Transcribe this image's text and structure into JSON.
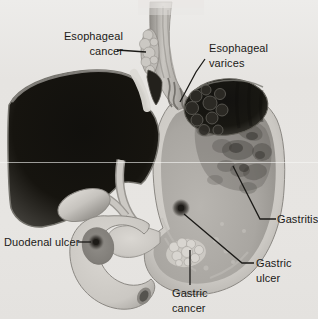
{
  "illustration": {
    "title": "Upper digestive tract disorders diagram",
    "background": "#e7e5e2",
    "ink": "#1b1a17",
    "labels": {
      "esophageal_cancer": {
        "line1": "Esophageal",
        "line2": "cancer"
      },
      "esophageal_varices": {
        "line1": "Esophageal",
        "line2": "varices"
      },
      "gastritis": {
        "text": "Gastritis"
      },
      "duodenal_ulcer": {
        "text": "Duodenal ulcer"
      },
      "gastric_ulcer": {
        "line1": "Gastric",
        "line2": "ulcer"
      },
      "gastric_cancer": {
        "line1": "Gastric",
        "line2": "cancer"
      }
    },
    "palette": {
      "liver_dark": "#14130f",
      "spleen_dark": "#151410",
      "organ_wall_light": "#cbc8c3",
      "stomach_interior": "#a9a6a1",
      "lesion_dark": "#2a2823",
      "ligament_highlight": "#dcdad5",
      "leader_line": "#1b1a17",
      "scan_artifact_line": "#f8f8f6"
    }
  }
}
